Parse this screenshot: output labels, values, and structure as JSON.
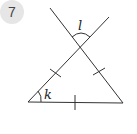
{
  "problem_number": "7",
  "figure": {
    "labels": {
      "top_angle": "l",
      "bottom_left_angle": "k"
    },
    "colors": {
      "line": "#333333",
      "badge_bg": "#e6e6e6"
    }
  }
}
